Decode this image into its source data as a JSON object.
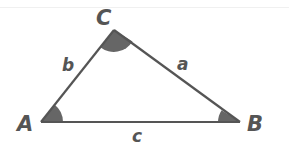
{
  "diagram": {
    "type": "triangle",
    "vertices": [
      {
        "label": "A",
        "x": 41,
        "y": 122
      },
      {
        "label": "B",
        "x": 240,
        "y": 122
      },
      {
        "label": "C",
        "x": 114,
        "y": 30
      }
    ],
    "sides": [
      {
        "label": "a",
        "between": "B-C"
      },
      {
        "label": "b",
        "between": "A-C"
      },
      {
        "label": "c",
        "between": "A-B"
      }
    ],
    "angle_marks": [
      "A",
      "B",
      "C"
    ],
    "colors": {
      "line": "#555555",
      "angle_fill": "#666666",
      "label": "#555555",
      "background": "#ffffff"
    }
  },
  "labels": {
    "A": "A",
    "B": "B",
    "C": "C",
    "a": "a",
    "b": "b",
    "c": "c"
  }
}
